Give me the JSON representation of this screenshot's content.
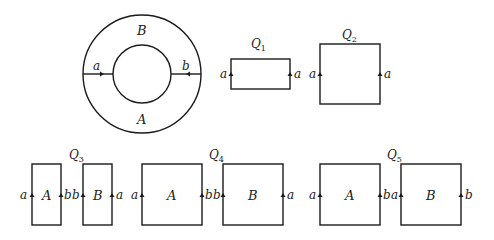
{
  "annulus": {
    "region_top": "B",
    "region_bottom": "A",
    "left_edge_label": "a",
    "right_edge_label": "b"
  },
  "q1": {
    "title": "Q",
    "sub": "1",
    "left": "a",
    "right": "a"
  },
  "q2": {
    "title": "Q",
    "sub": "2",
    "left": "a",
    "right": "a"
  },
  "q3": {
    "title": "Q",
    "sub": "3",
    "rect1": {
      "region": "A",
      "left": "a",
      "right": "b"
    },
    "rect2": {
      "region": "B",
      "left": "b",
      "right": "a"
    }
  },
  "q4": {
    "title": "Q",
    "sub": "4",
    "rect1": {
      "region": "A",
      "left": "a",
      "right": "b"
    },
    "rect2": {
      "region": "B",
      "left": "b",
      "right": "a"
    }
  },
  "q5": {
    "title": "Q",
    "sub": "5",
    "rect1": {
      "region": "A",
      "left": "a",
      "right": "b"
    },
    "rect2": {
      "region": "B",
      "left": "a",
      "right": "b"
    }
  }
}
